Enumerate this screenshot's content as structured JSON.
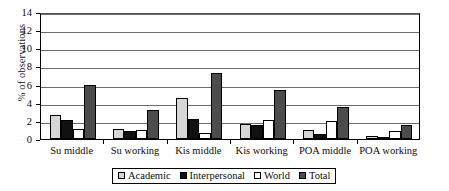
{
  "chart_data": {
    "type": "bar",
    "title": "",
    "xlabel": "",
    "ylabel": "% of observations",
    "ylim": [
      0,
      14
    ],
    "ytick_step": 2,
    "yticks": [
      0,
      2,
      4,
      6,
      8,
      10,
      12,
      14
    ],
    "grid": true,
    "legend_position": "bottom",
    "categories": [
      "Su middle",
      "Su working",
      "Kis middle",
      "Kis working",
      "POA middle",
      "POA working"
    ],
    "series": [
      {
        "name": "Academic",
        "color": "#d6d6d6",
        "values": [
          2.6,
          1.15,
          4.5,
          1.7,
          0.95,
          0.3
        ]
      },
      {
        "name": "Interpersonal",
        "color": "#111111",
        "values": [
          2.1,
          0.85,
          2.2,
          1.55,
          0.55,
          0.1
        ]
      },
      {
        "name": "World",
        "color": "#ffffff",
        "values": [
          1.15,
          1.0,
          0.65,
          2.15,
          2.0,
          0.9
        ]
      },
      {
        "name": "Total",
        "color": "#4c4c4c",
        "values": [
          5.9,
          3.2,
          7.3,
          5.45,
          3.55,
          1.5
        ]
      }
    ]
  }
}
